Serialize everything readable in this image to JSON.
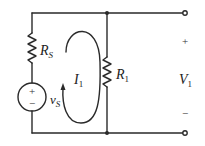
{
  "diagram": {
    "type": "circuit-schematic",
    "colors": {
      "background": "#ffffff",
      "wire": "#2a2a2a",
      "text": "#222222"
    },
    "components": {
      "source_resistor": {
        "symbol": "R",
        "subscript": "S"
      },
      "voltage_source": {
        "symbol": "v",
        "subscript": "S",
        "plus": "+",
        "minus": "−"
      },
      "load_resistor": {
        "symbol": "R",
        "subscript": "1"
      },
      "loop_current": {
        "symbol": "I",
        "subscript": "1"
      },
      "output_voltage": {
        "symbol": "V",
        "subscript": "1",
        "plus": "+",
        "minus": "−"
      }
    },
    "nodes": [
      "top-junction",
      "bottom-junction",
      "top-terminal",
      "bottom-terminal"
    ]
  }
}
